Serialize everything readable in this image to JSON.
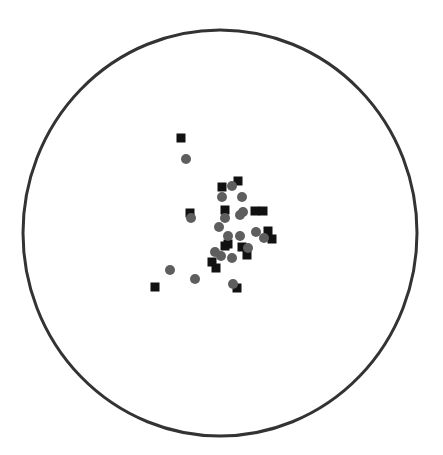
{
  "chart_data": {
    "type": "scatter",
    "title": "",
    "xlabel": "",
    "ylabel": "",
    "grid": false,
    "legend": null,
    "boundary": {
      "shape": "circle",
      "cx": 220,
      "cy": 233,
      "rx": 197,
      "ry": 203,
      "stroke": "#333333",
      "stroke_width": 3
    },
    "series": [
      {
        "name": "squares",
        "marker": "square",
        "color": "#111111",
        "size": 9,
        "points": [
          [
            181,
            138
          ],
          [
            190,
            213
          ],
          [
            222,
            187
          ],
          [
            238,
            181
          ],
          [
            225,
            210
          ],
          [
            255,
            211
          ],
          [
            263,
            211
          ],
          [
            268,
            231
          ],
          [
            272,
            239
          ],
          [
            228,
            244
          ],
          [
            242,
            247
          ],
          [
            247,
            255
          ],
          [
            225,
            246
          ],
          [
            212,
            262
          ],
          [
            216,
            268
          ],
          [
            155,
            287
          ],
          [
            237,
            288
          ]
        ]
      },
      {
        "name": "circles",
        "marker": "circle",
        "color": "#5e5e5e",
        "size": 10,
        "points": [
          [
            186,
            159
          ],
          [
            191,
            218
          ],
          [
            232,
            186
          ],
          [
            222,
            197
          ],
          [
            242,
            197
          ],
          [
            225,
            218
          ],
          [
            240,
            215
          ],
          [
            243,
            212
          ],
          [
            219,
            227
          ],
          [
            228,
            236
          ],
          [
            240,
            236
          ],
          [
            256,
            232
          ],
          [
            264,
            238
          ],
          [
            248,
            248
          ],
          [
            215,
            252
          ],
          [
            221,
            256
          ],
          [
            232,
            258
          ],
          [
            170,
            270
          ],
          [
            195,
            279
          ],
          [
            233,
            284
          ]
        ]
      }
    ]
  }
}
